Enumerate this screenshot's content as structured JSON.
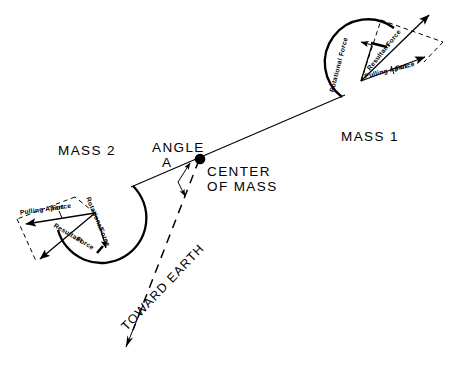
{
  "figure": {
    "title_visible": false,
    "background_color": "#ffffff",
    "ink_color": "#000000"
  },
  "center": {
    "marker_name": "center-of-mass-dot",
    "label_line1": "CENTER",
    "label_line2": "OF  MASS"
  },
  "angle": {
    "label_line1": "ANGLE",
    "label_line2": "A"
  },
  "earth": {
    "label": "TOWARD  EARTH"
  },
  "masses": [
    {
      "id": "mass-1",
      "label": "MASS  1",
      "forces": {
        "rotational_line1": "Rotational",
        "rotational_line2": "Force",
        "resultant_line1": "Resultant",
        "resultant_line2": "Force",
        "pulling_line1": "Pulling   Apart",
        "pulling_line2": "Force"
      }
    },
    {
      "id": "mass-2",
      "label": "MASS  2",
      "forces": {
        "rotational_line1": "Rotational",
        "rotational_line2": "Force",
        "resultant_line1": "Resultant",
        "resultant_line2": "Force",
        "pulling_line1": "Pulling   Apart",
        "pulling_line2": "Force"
      }
    }
  ]
}
